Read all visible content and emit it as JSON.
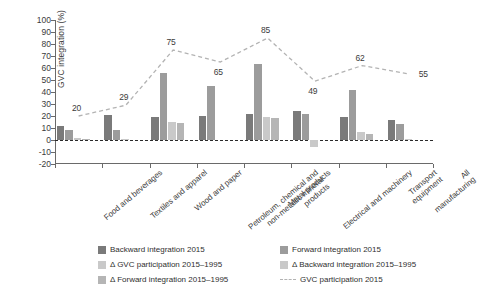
{
  "figure": {
    "cut_title": "",
    "ylabel": "GVC integration (%)"
  },
  "chart_data": {
    "type": "bar",
    "title": "",
    "xlabel": "",
    "ylabel": "GVC integration (%)",
    "ylim": [
      -20,
      100
    ],
    "yticks": [
      100,
      90,
      80,
      70,
      60,
      50,
      40,
      30,
      20,
      10,
      0,
      -10,
      -20
    ],
    "grid": false,
    "legend_position": "bottom",
    "categories": [
      "Food and beverages",
      "Textiles and apparel",
      "Wood and paper",
      "Petroleum, chemical and\nnon-metallic mineral\nproducts",
      "Metal products",
      "Electrical and machinery",
      "Transport equipment",
      "All manufacturing"
    ],
    "series": [
      {
        "name": "Backward integration 2015",
        "type": "bar",
        "color": "#7a7a7a",
        "values": [
          12,
          21,
          19,
          20,
          22,
          24,
          19,
          17
        ]
      },
      {
        "name": "Forward integration 2015",
        "type": "bar",
        "color": "#9c9c9c",
        "values": [
          8,
          8,
          56,
          45,
          63,
          22,
          42,
          13
        ]
      },
      {
        "name": "Δ GVC participation 2015–1995",
        "type": "bar",
        "color": "#c9c9c9",
        "values": [
          2,
          1,
          15,
          0,
          19,
          -6,
          7,
          1
        ]
      },
      {
        "name": "Δ Backward integration 2015–1995",
        "type": "bar",
        "color": "#b5b5b5",
        "values": [
          1,
          0,
          14,
          0,
          18,
          0,
          5,
          0
        ]
      },
      {
        "name": "Δ Forward integration 2015–1995",
        "type": "bar",
        "color": "#8c8c8c",
        "values": [
          0,
          0,
          0,
          0,
          0,
          0,
          0,
          0
        ]
      },
      {
        "name": "GVC participation 2015",
        "type": "line",
        "style": "dashed",
        "color": "#b3b3b3",
        "values": [
          20,
          29,
          75,
          65,
          85,
          49,
          62,
          55
        ],
        "labels": [
          "20",
          "29",
          "75",
          "65",
          "85",
          "49",
          "62",
          "55"
        ]
      }
    ]
  },
  "legend": {
    "items": [
      {
        "label": "Backward integration 2015",
        "swatch": "#7a7a7a",
        "kind": "box"
      },
      {
        "label": "Forward integration 2015",
        "swatch": "#9c9c9c",
        "kind": "box"
      },
      {
        "label": "Δ GVC participation 2015–1995",
        "swatch": "#c9c9c9",
        "kind": "box"
      },
      {
        "label": "Δ Backward integration 2015–1995",
        "swatch": "#c9c9c9",
        "kind": "box"
      },
      {
        "label": "Δ Forward integration 2015–1995",
        "swatch": "#b5b5b5",
        "kind": "box"
      },
      {
        "label": "GVC participation 2015",
        "swatch": "#b3b3b3",
        "kind": "line"
      }
    ]
  }
}
